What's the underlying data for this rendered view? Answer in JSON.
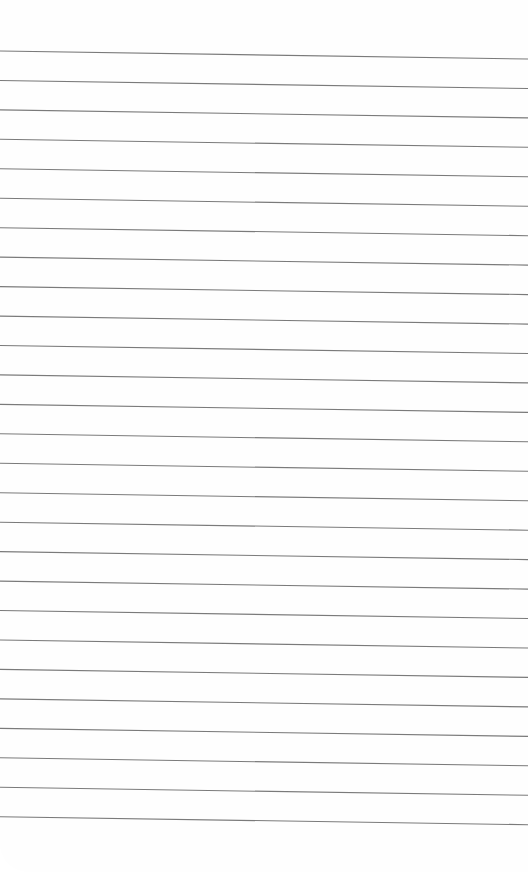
{
  "sheet": {
    "type": "lined-paper",
    "background_color": "#fefefe",
    "line_color": "#7a7a7a",
    "line_count": 27,
    "first_line_y_left": 51,
    "first_line_y_right": 59,
    "line_spacing": 29.45,
    "text": ""
  }
}
